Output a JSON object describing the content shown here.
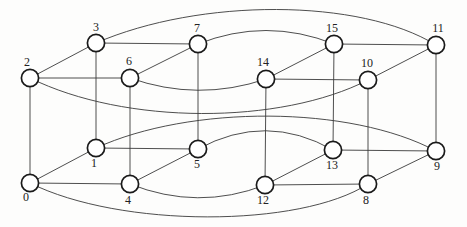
{
  "figure": {
    "type": "graph-diagram",
    "background_color": "#fdfdfc",
    "edge_color": "#3a3a3a",
    "edge_width": 0.9,
    "node_fill": "#ffffff",
    "node_stroke": "#1a1a1a",
    "node_stroke_width": 1.7,
    "node_radius": 8.6,
    "label_color": "#222222",
    "nodes": [
      {
        "id": 0,
        "label": "0",
        "x": 30,
        "y": 183,
        "lx": 26,
        "ly": 197
      },
      {
        "id": 1,
        "label": "1",
        "x": 96,
        "y": 148,
        "lx": 94,
        "ly": 163
      },
      {
        "id": 2,
        "label": "2",
        "x": 30,
        "y": 78,
        "lx": 27,
        "ly": 62
      },
      {
        "id": 3,
        "label": "3",
        "x": 96,
        "y": 43,
        "lx": 96,
        "ly": 27
      },
      {
        "id": 4,
        "label": "4",
        "x": 130,
        "y": 184,
        "lx": 128,
        "ly": 200
      },
      {
        "id": 5,
        "label": "5",
        "x": 198,
        "y": 149,
        "lx": 197,
        "ly": 164
      },
      {
        "id": 6,
        "label": "6",
        "x": 130,
        "y": 78,
        "lx": 129,
        "ly": 61
      },
      {
        "id": 7,
        "label": "7",
        "x": 198,
        "y": 44,
        "lx": 197,
        "ly": 28
      },
      {
        "id": 8,
        "label": "8",
        "x": 368,
        "y": 184,
        "lx": 366,
        "ly": 200
      },
      {
        "id": 9,
        "label": "9",
        "x": 436,
        "y": 151,
        "lx": 437,
        "ly": 166
      },
      {
        "id": 10,
        "label": "10",
        "x": 368,
        "y": 80,
        "lx": 367,
        "ly": 63
      },
      {
        "id": 11,
        "label": "11",
        "x": 436,
        "y": 45,
        "lx": 438,
        "ly": 28
      },
      {
        "id": 12,
        "label": "12",
        "x": 265,
        "y": 185,
        "lx": 263,
        "ly": 200
      },
      {
        "id": 13,
        "label": "13",
        "x": 333,
        "y": 150,
        "lx": 332,
        "ly": 165
      },
      {
        "id": 14,
        "label": "14",
        "x": 266,
        "y": 79,
        "lx": 263,
        "ly": 62
      },
      {
        "id": 15,
        "label": "15",
        "x": 334,
        "y": 44,
        "lx": 332,
        "ly": 28
      }
    ],
    "edges": {
      "straight": [
        [
          0,
          1
        ],
        [
          0,
          2
        ],
        [
          0,
          4
        ],
        [
          1,
          3
        ],
        [
          1,
          5
        ],
        [
          2,
          3
        ],
        [
          2,
          6
        ],
        [
          3,
          7
        ],
        [
          4,
          5
        ],
        [
          4,
          6
        ],
        [
          5,
          7
        ],
        [
          6,
          7
        ],
        [
          8,
          9
        ],
        [
          8,
          10
        ],
        [
          8,
          12
        ],
        [
          9,
          11
        ],
        [
          9,
          13
        ],
        [
          10,
          11
        ],
        [
          10,
          14
        ],
        [
          11,
          15
        ],
        [
          12,
          13
        ],
        [
          12,
          14
        ],
        [
          13,
          15
        ],
        [
          14,
          15
        ]
      ],
      "curved": [
        {
          "from": 0,
          "to": 8,
          "cp": [
            [
              120,
              228
            ],
            [
              300,
              228
            ]
          ]
        },
        {
          "from": 1,
          "to": 9,
          "cp": [
            [
              190,
              105
            ],
            [
              350,
              105
            ]
          ]
        },
        {
          "from": 2,
          "to": 10,
          "cp": [
            [
              125,
              125
            ],
            [
              280,
              125
            ]
          ]
        },
        {
          "from": 3,
          "to": 11,
          "cp": [
            [
              200,
              -2
            ],
            [
              360,
              -2
            ]
          ]
        },
        {
          "from": 4,
          "to": 12,
          "cp": [
            [
              198,
              211
            ]
          ]
        },
        {
          "from": 5,
          "to": 13,
          "cp": [
            [
              266,
              112
            ]
          ]
        },
        {
          "from": 6,
          "to": 14,
          "cp": [
            [
              198,
              102
            ]
          ]
        },
        {
          "from": 7,
          "to": 15,
          "cp": [
            [
              266,
              17
            ]
          ]
        }
      ]
    }
  }
}
